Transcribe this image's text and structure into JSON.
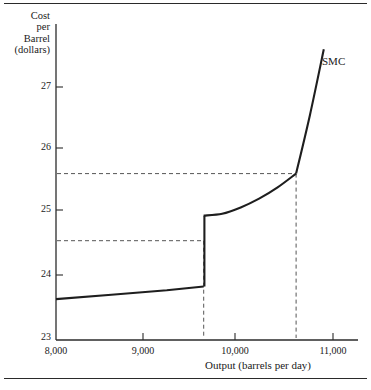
{
  "chart_data": {
    "type": "line",
    "title": "",
    "subtitle": "",
    "xlabel": "Output (barrels per day)",
    "ylabel": "Cost per Barrel (dollars)",
    "ylabel_lines": [
      "Cost",
      "per",
      "Barrel",
      "(dollars)"
    ],
    "xlim": [
      8000,
      11000
    ],
    "ylim": [
      23,
      27.8
    ],
    "xticks": [
      8000,
      9000,
      10000,
      11000
    ],
    "xticklabels": [
      "8,000",
      "9,000",
      "10,000",
      "11,000"
    ],
    "yticks": [
      23,
      24,
      25,
      26,
      27
    ],
    "yticklabels": [
      "23",
      "24",
      "25",
      "26",
      "27"
    ],
    "grid": false,
    "legend_position": "inline-right",
    "series": [
      {
        "name": "SMC",
        "label": "SMC",
        "color": "#1e1e1e",
        "note": "Short-run marginal cost with a discontinuous jump at 9,600 barrels per day and a kink at 10,600",
        "segments": [
          {
            "name": "lower-branch",
            "points": [
              [
                8000,
                23.62
              ],
              [
                8600,
                23.69
              ],
              [
                9200,
                23.76
              ],
              [
                9600,
                23.82
              ]
            ]
          },
          {
            "name": "vertical-jump",
            "points": [
              [
                9600,
                23.82
              ],
              [
                9600,
                24.95
              ]
            ]
          },
          {
            "name": "upper-branch",
            "points": [
              [
                9600,
                24.95
              ],
              [
                9800,
                24.98
              ],
              [
                10000,
                25.08
              ],
              [
                10200,
                25.22
              ],
              [
                10400,
                25.4
              ],
              [
                10600,
                25.62
              ]
            ]
          },
          {
            "name": "steep-branch",
            "points": [
              [
                10600,
                25.62
              ],
              [
                10750,
                26.55
              ],
              [
                10900,
                27.6
              ]
            ]
          }
        ]
      }
    ],
    "annotations": [
      {
        "name": "guide-horizontal-upper",
        "type": "hline",
        "y": 25.62,
        "x_from": 8000,
        "x_to": 10600,
        "style": "dashed"
      },
      {
        "name": "guide-horizontal-lower",
        "type": "hline",
        "y": 24.55,
        "x_from": 8000,
        "x_to": 9600,
        "style": "dashed"
      },
      {
        "name": "guide-vertical-left",
        "type": "vline",
        "x": 9600,
        "y_from": 23.0,
        "y_to": 24.55,
        "style": "dashed"
      },
      {
        "name": "guide-vertical-right",
        "type": "vline",
        "x": 10600,
        "y_from": 23.0,
        "y_to": 25.62,
        "style": "dashed"
      }
    ]
  },
  "axes": {
    "y_title_lines": [
      "Cost",
      "per",
      "Barrel",
      "(dollars)"
    ],
    "x_title": "Output (barrels per day)",
    "y_tick_labels": [
      "27",
      "26",
      "25",
      "24",
      "23"
    ],
    "x_tick_labels": [
      "8,000",
      "9,000",
      "10,000",
      "11,000"
    ]
  },
  "series_label": "SMC",
  "colors": {
    "curve": "#1e1e1e",
    "axis": "#2b2b2b",
    "guide": "#555555",
    "rule": "#2a2a2a",
    "background": "#ffffff"
  }
}
